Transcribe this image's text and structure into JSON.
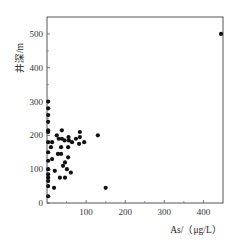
{
  "chart_data": {
    "type": "scatter",
    "title": "",
    "xlabel": "As/（μg/L）",
    "ylabel": "井深/m",
    "xlim": [
      0,
      450
    ],
    "ylim": [
      0,
      550
    ],
    "xticks": [
      100,
      200,
      300,
      400
    ],
    "xticks_minor": [
      50,
      150,
      250,
      350
    ],
    "yticks": [
      0,
      100,
      200,
      300,
      400,
      500
    ],
    "yticks_minor": [
      50,
      150,
      250,
      350,
      450
    ],
    "grid": false,
    "legend": null,
    "marker_color": "#111111",
    "series": [
      {
        "name": "wells",
        "points": [
          {
            "x": 3,
            "y": 300
          },
          {
            "x": 3,
            "y": 280
          },
          {
            "x": 3,
            "y": 260
          },
          {
            "x": 3,
            "y": 240
          },
          {
            "x": 3,
            "y": 215
          },
          {
            "x": 3,
            "y": 210
          },
          {
            "x": 3,
            "y": 180
          },
          {
            "x": 3,
            "y": 150
          },
          {
            "x": 3,
            "y": 125
          },
          {
            "x": 3,
            "y": 100
          },
          {
            "x": 3,
            "y": 85
          },
          {
            "x": 3,
            "y": 75
          },
          {
            "x": 3,
            "y": 65
          },
          {
            "x": 3,
            "y": 50
          },
          {
            "x": 3,
            "y": 20
          },
          {
            "x": 25,
            "y": 200
          },
          {
            "x": 30,
            "y": 190
          },
          {
            "x": 38,
            "y": 190
          },
          {
            "x": 45,
            "y": 185
          },
          {
            "x": 55,
            "y": 195
          },
          {
            "x": 38,
            "y": 215
          },
          {
            "x": 56,
            "y": 185
          },
          {
            "x": 64,
            "y": 180
          },
          {
            "x": 74,
            "y": 190
          },
          {
            "x": 84,
            "y": 195
          },
          {
            "x": 54,
            "y": 165
          },
          {
            "x": 36,
            "y": 165
          },
          {
            "x": 28,
            "y": 145
          },
          {
            "x": 36,
            "y": 145
          },
          {
            "x": 46,
            "y": 120
          },
          {
            "x": 54,
            "y": 135
          },
          {
            "x": 41,
            "y": 110
          },
          {
            "x": 51,
            "y": 100
          },
          {
            "x": 61,
            "y": 90
          },
          {
            "x": 20,
            "y": 95
          },
          {
            "x": 33,
            "y": 75
          },
          {
            "x": 46,
            "y": 75
          },
          {
            "x": 18,
            "y": 45
          },
          {
            "x": 84,
            "y": 210
          },
          {
            "x": 95,
            "y": 180
          },
          {
            "x": 82,
            "y": 175
          },
          {
            "x": 13,
            "y": 180
          },
          {
            "x": 10,
            "y": 165
          },
          {
            "x": 13,
            "y": 130
          },
          {
            "x": 130,
            "y": 200
          },
          {
            "x": 150,
            "y": 45
          },
          {
            "x": 445,
            "y": 500
          }
        ]
      }
    ]
  }
}
